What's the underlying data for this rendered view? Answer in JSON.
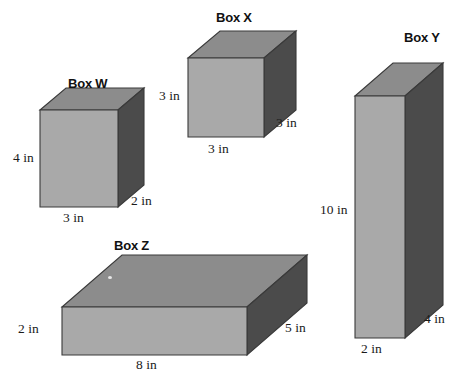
{
  "figure": {
    "kind": "geometry-diagram",
    "unit": "in",
    "background_color": "#ffffff",
    "face_colors": {
      "front": "#a9a9a9",
      "top": "#8c8c8c",
      "side": "#4b4b4b",
      "outline": "#3a3a3a"
    }
  },
  "boxes": [
    {
      "id": "box-w",
      "title": "Box W",
      "labels": {
        "height": "4 in",
        "width": "3 in",
        "depth": "2 in"
      },
      "dimensions": {
        "width": 3,
        "height": 4,
        "depth": 2
      }
    },
    {
      "id": "box-x",
      "title": "Box X",
      "labels": {
        "height": "3 in",
        "width": "3 in",
        "depth": "3 in"
      },
      "dimensions": {
        "width": 3,
        "height": 3,
        "depth": 3
      }
    },
    {
      "id": "box-y",
      "title": "Box Y",
      "labels": {
        "height": "10 in",
        "width": "2 in",
        "depth": "4 in"
      },
      "dimensions": {
        "width": 2,
        "height": 10,
        "depth": 4
      }
    },
    {
      "id": "box-z",
      "title": "Box Z",
      "labels": {
        "height": "2 in",
        "width": "8 in",
        "depth": "5 in"
      },
      "dimensions": {
        "width": 8,
        "height": 2,
        "depth": 5
      }
    }
  ]
}
